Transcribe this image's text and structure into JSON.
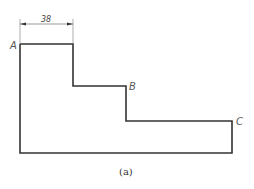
{
  "figure": {
    "caption": "(a)",
    "dimension": {
      "value": "38"
    },
    "points": [
      {
        "id": "A",
        "label": "A"
      },
      {
        "id": "B",
        "label": "B"
      },
      {
        "id": "C",
        "label": "C"
      }
    ],
    "colors": {
      "outline": "#333333",
      "label": "#555555",
      "background": "#ffffff"
    }
  }
}
